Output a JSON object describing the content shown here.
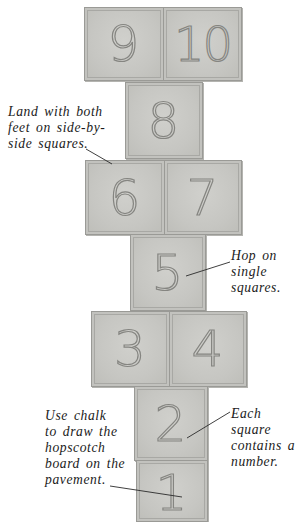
{
  "squares": [
    {
      "id": "9",
      "label": "9",
      "x": 84,
      "y": 7,
      "w": 80,
      "h": 74
    },
    {
      "id": "10",
      "label": "10",
      "x": 163,
      "y": 7,
      "w": 79,
      "h": 74
    },
    {
      "id": "8",
      "label": "8",
      "x": 125,
      "y": 82,
      "w": 78,
      "h": 77
    },
    {
      "id": "6",
      "label": "6",
      "x": 85,
      "y": 160,
      "w": 80,
      "h": 75
    },
    {
      "id": "7",
      "label": "7",
      "x": 164,
      "y": 160,
      "w": 78,
      "h": 75
    },
    {
      "id": "5",
      "label": "5",
      "x": 130,
      "y": 234,
      "w": 76,
      "h": 77
    },
    {
      "id": "3",
      "label": "3",
      "x": 91,
      "y": 311,
      "w": 79,
      "h": 76
    },
    {
      "id": "4",
      "label": "4",
      "x": 169,
      "y": 311,
      "w": 78,
      "h": 76
    },
    {
      "id": "2",
      "label": "2",
      "x": 134,
      "y": 386,
      "w": 74,
      "h": 75
    },
    {
      "id": "1",
      "label": "1",
      "x": 136,
      "y": 460,
      "w": 72,
      "h": 62
    }
  ],
  "annotations": {
    "side_by_side": {
      "lines": [
        "Land with both",
        "feet on side-by-",
        "side squares."
      ]
    },
    "hop_single": {
      "lines": [
        "Hop on",
        "single",
        "squares."
      ]
    },
    "each_square": {
      "lines": [
        "Each square",
        "contains a",
        "number."
      ]
    },
    "use_chalk": {
      "lines": [
        "Use chalk",
        "to draw the",
        "hopscotch",
        "board on the",
        "pavement."
      ]
    }
  },
  "colors": {
    "square_fill": "#c8c8c4",
    "square_border": "#9a9a96",
    "numeral_stroke": "#858581",
    "text": "#1a1a1a",
    "background": "#ffffff"
  }
}
